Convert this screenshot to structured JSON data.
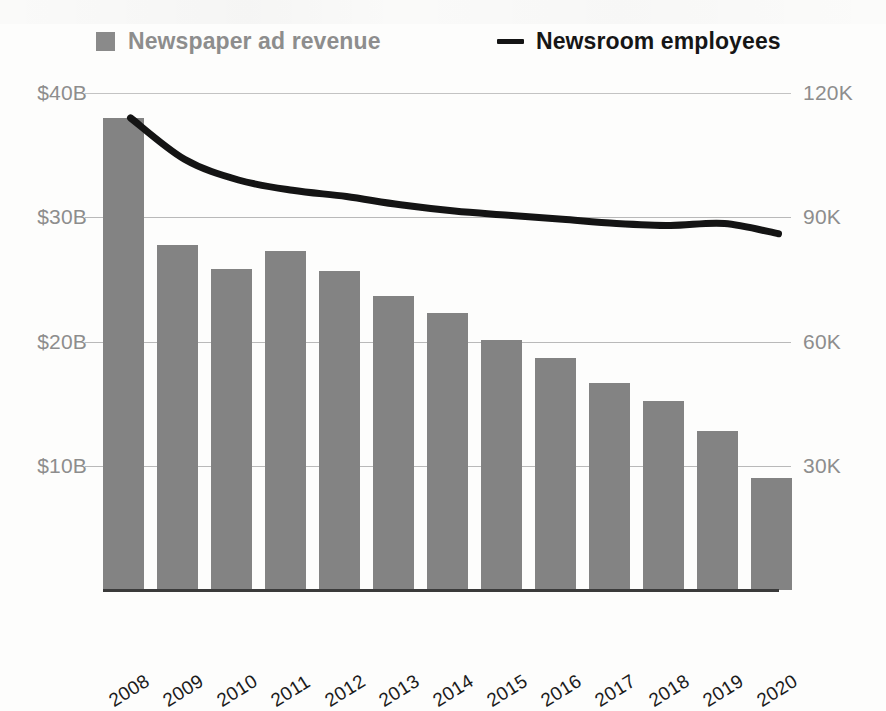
{
  "legend": {
    "bars": {
      "label": "Newspaper ad revenue",
      "color": "#838383",
      "marker": "square-swatch"
    },
    "line": {
      "label": "Newsroom employees",
      "color": "#141414",
      "marker": "dash-line"
    }
  },
  "chart_data": {
    "type": "bar",
    "title": "",
    "subtitle": "",
    "xlabel": "",
    "grid": true,
    "legend_position": "top",
    "categories": [
      "2008",
      "2009",
      "2010",
      "2011",
      "2012",
      "2013",
      "2014",
      "2015",
      "2016",
      "2017",
      "2018",
      "2019",
      "2020"
    ],
    "series": [
      {
        "name": "Newspaper ad revenue",
        "type": "bar",
        "axis": "left",
        "unit": "USD billions",
        "color": "#838383",
        "values": [
          38.0,
          27.8,
          25.8,
          27.3,
          25.7,
          23.7,
          22.3,
          20.1,
          18.7,
          16.7,
          15.2,
          12.8,
          9.0
        ]
      },
      {
        "name": "Newsroom employees",
        "type": "line",
        "axis": "right",
        "unit": "employees",
        "color": "#141414",
        "values": [
          114000,
          104000,
          99000,
          96500,
          95000,
          93000,
          91500,
          90500,
          89500,
          88500,
          88000,
          88500,
          86000
        ]
      }
    ],
    "left_axis": {
      "label": "",
      "ylim": [
        0,
        40
      ],
      "ticks": [
        10,
        20,
        30,
        40
      ],
      "tick_labels": [
        "$10B",
        "$20B",
        "$30B",
        "$40B"
      ]
    },
    "right_axis": {
      "label": "",
      "ylim": [
        0,
        120000
      ],
      "ticks": [
        30000,
        60000,
        90000,
        120000
      ],
      "tick_labels": [
        "30K",
        "60K",
        "90K",
        "120K"
      ]
    }
  }
}
